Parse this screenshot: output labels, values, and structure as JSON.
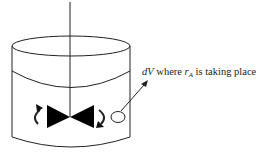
{
  "diagram": {
    "elements": [
      "tank",
      "liquid-surface",
      "shaft",
      "impeller",
      "rotation-arrows",
      "volume-element",
      "pointer-arrow"
    ],
    "label": {
      "dV": "dV",
      "where": " where ",
      "r": "r",
      "sub": "A",
      "rest": " is taking place"
    },
    "colors": {
      "stroke": "#222222",
      "fill": "#000000",
      "background": "#ffffff"
    }
  }
}
